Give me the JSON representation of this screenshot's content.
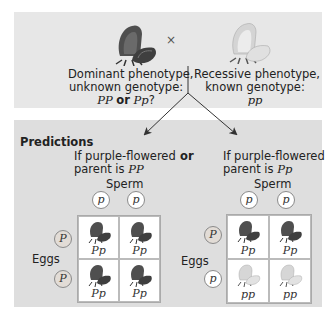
{
  "cross": {
    "symbol": "×",
    "left_parent": {
      "flower": "purple-flower-icon",
      "line1": "Dominant phenotype,",
      "line2": "unknown genotype:",
      "genotype_a": "PP",
      "or": "or",
      "genotype_b": "Pp",
      "suffix": "?"
    },
    "right_parent": {
      "flower": "white-flower-icon",
      "line1": "Recessive phenotype,",
      "line2": "known genotype:",
      "genotype": "pp"
    }
  },
  "predictions": {
    "title": "Predictions",
    "or": "or",
    "left": {
      "line1": "If purple-flowered",
      "line2_prefix": "parent is ",
      "genotype": "PP",
      "sperm_label": "Sperm",
      "eggs_label": "Eggs",
      "sperm": [
        "p",
        "p"
      ],
      "eggs": [
        "P",
        "P"
      ],
      "offspring": [
        {
          "genotype": "Pp",
          "color": "purple"
        },
        {
          "genotype": "Pp",
          "color": "purple"
        },
        {
          "genotype": "Pp",
          "color": "purple"
        },
        {
          "genotype": "Pp",
          "color": "purple"
        }
      ]
    },
    "right": {
      "line1": "If purple-flowered",
      "line2_prefix": "parent is ",
      "genotype": "Pp",
      "sperm_label": "Sperm",
      "eggs_label": "Eggs",
      "sperm": [
        "p",
        "p"
      ],
      "eggs": [
        "P",
        "p"
      ],
      "offspring": [
        {
          "genotype": "Pp",
          "color": "purple"
        },
        {
          "genotype": "Pp",
          "color": "purple"
        },
        {
          "genotype": "pp",
          "color": "white"
        },
        {
          "genotype": "pp",
          "color": "white"
        }
      ]
    }
  },
  "colors": {
    "panel_bg": "#e7e7e7",
    "predictions_bg": "#dedede",
    "purple_flower": "#4a4a4a",
    "white_flower": "#d8d8d8"
  }
}
